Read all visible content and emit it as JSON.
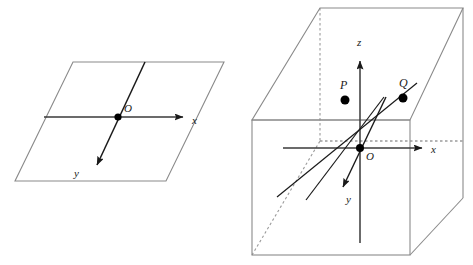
{
  "figure": {
    "background_color": "#ffffff",
    "stroke_color": "#3a3a3a",
    "axis_color": "#2b2b2b",
    "point_color": "#000000"
  },
  "left_diagram": {
    "name": "two-dimensional-coordinate-plane",
    "plane_shape": "parallelogram",
    "origin_label": "O",
    "axes": [
      {
        "name": "x-axis",
        "label": "x",
        "direction": "right"
      },
      {
        "name": "y-axis",
        "label": "y",
        "direction": "down-left"
      }
    ]
  },
  "right_diagram": {
    "name": "three-dimensional-coordinate-box",
    "box_shape": "rectangular-prism",
    "origin_label": "O",
    "axes": [
      {
        "name": "x-axis",
        "label": "x",
        "direction": "right"
      },
      {
        "name": "y-axis",
        "label": "y",
        "direction": "down-left-front"
      },
      {
        "name": "z-axis",
        "label": "z",
        "direction": "up"
      }
    ],
    "points": [
      {
        "name": "point-P",
        "label": "P"
      },
      {
        "name": "point-Q",
        "label": "Q"
      }
    ],
    "oblique_lines": 2,
    "hidden_edges_style": "dashed"
  }
}
